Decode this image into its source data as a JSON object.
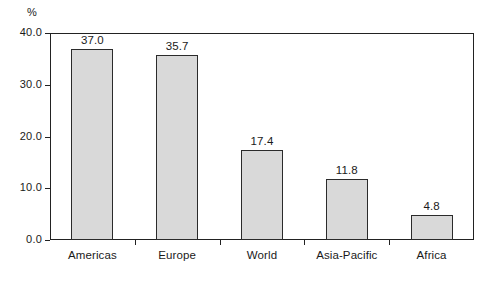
{
  "chart_data": {
    "type": "bar",
    "title": "",
    "subtitle": "",
    "xlabel": "",
    "ylabel": "%",
    "unit_caption": "%",
    "categories": [
      "Americas",
      "Europe",
      "World",
      "Asia-Pacific",
      "Africa"
    ],
    "values": [
      37.0,
      35.7,
      17.4,
      11.8,
      4.8
    ],
    "value_labels": [
      "37.0",
      "35.7",
      "17.4",
      "11.8",
      "4.8"
    ],
    "ylim": [
      0.0,
      40.0
    ],
    "yticks": [
      0.0,
      10.0,
      20.0,
      30.0,
      40.0
    ],
    "ytick_labels": [
      "0.0",
      "10.0",
      "20.0",
      "30.0",
      "40.0"
    ],
    "grid": false,
    "legend": false,
    "legend_position": "none",
    "bar_fill": "#d9d9d9",
    "bar_edge": "#2b2b2b",
    "frame_color": "#222222",
    "background": "#ffffff"
  }
}
